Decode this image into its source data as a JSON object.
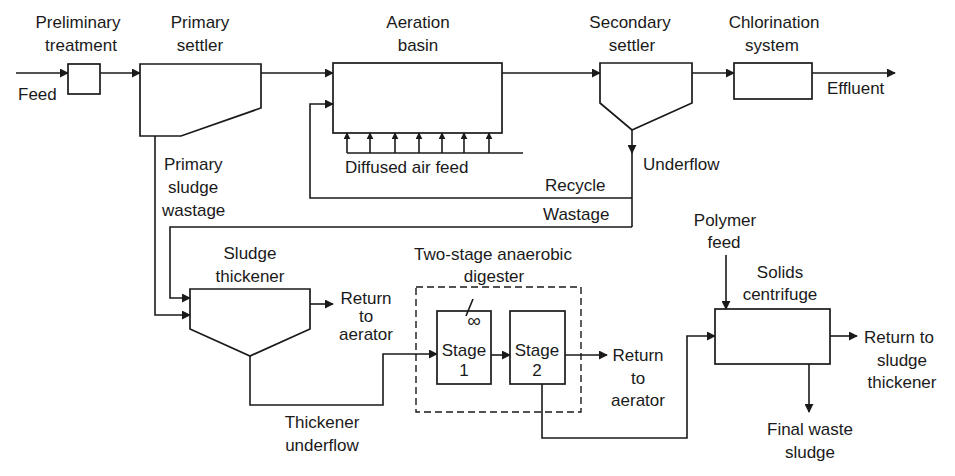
{
  "diagram": {
    "type": "process-flow",
    "colors": {
      "line": "#1a1a1a",
      "background": "#ffffff"
    },
    "units": {
      "preliminary": {
        "title_line1": "Preliminary",
        "title_line2": "treatment"
      },
      "primary_settler": {
        "title_line1": "Primary",
        "title_line2": "settler"
      },
      "aeration_basin": {
        "title_line1": "Aeration",
        "title_line2": "basin"
      },
      "secondary_settler": {
        "title_line1": "Secondary",
        "title_line2": "settler"
      },
      "chlorination": {
        "title_line1": "Chlorination",
        "title_line2": "system"
      },
      "thickener": {
        "title_line1": "Sludge",
        "title_line2": "thickener"
      },
      "digester": {
        "title_line1": "Two-stage anaerobic",
        "title_line2": "digester",
        "mixer_symbol": "∞"
      },
      "stage1": {
        "line1": "Stage",
        "line2": "1"
      },
      "stage2": {
        "line1": "Stage",
        "line2": "2"
      },
      "centrifuge": {
        "title_line1": "Solids",
        "title_line2": "centrifuge"
      }
    },
    "streams": {
      "feed": "Feed",
      "effluent": "Effluent",
      "diffused_air": "Diffused air feed",
      "underflow": "Underflow",
      "recycle": "Recycle",
      "wastage": "Wastage",
      "primary_sludge": {
        "line1": "Primary",
        "line2": "sludge",
        "line3": "wastage"
      },
      "thickener_return": {
        "line1": "Return",
        "line2": "to",
        "line3": "aerator"
      },
      "thickener_underflow": {
        "line1": "Thickener",
        "line2": "underflow"
      },
      "digester_return": {
        "line1": "Return",
        "line2": "to",
        "line3": "aerator"
      },
      "polymer_feed": {
        "line1": "Polymer",
        "line2": "feed"
      },
      "centrifuge_return": {
        "line1": "Return to",
        "line2": "sludge",
        "line3": "thickener"
      },
      "final_waste": {
        "line1": "Final waste",
        "line2": "sludge"
      }
    }
  }
}
